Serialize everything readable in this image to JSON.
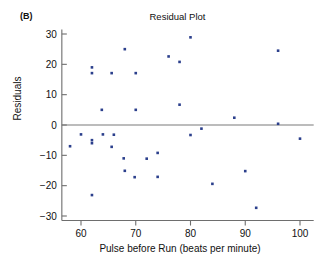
{
  "panel": {
    "label": "(B)"
  },
  "chart_data": {
    "type": "scatter",
    "title": "Residual Plot",
    "xlabel": "Pulse before Run (beats per minute)",
    "ylabel": "Residuals",
    "xlim": [
      56.5,
      102.5
    ],
    "ylim": [
      -31.5,
      31.5
    ],
    "xticks": [
      60,
      70,
      80,
      90,
      100
    ],
    "yticks": [
      30,
      20,
      10,
      0,
      -10,
      -20,
      -30
    ],
    "xtick_labels": [
      "60",
      "70",
      "80",
      "90",
      "100"
    ],
    "ytick_labels": [
      "30",
      "20",
      "10",
      "0",
      "−10",
      "−20",
      "−30"
    ],
    "grid": false,
    "legend": null,
    "reference_line": {
      "y": 0,
      "color": "#7a7a7a"
    },
    "marker": {
      "shape": "square",
      "size": 2.6,
      "color": "#2b3f8c"
    },
    "points": [
      {
        "x": 58.0,
        "y": -7.0
      },
      {
        "x": 60.0,
        "y": -3.1
      },
      {
        "x": 62.0,
        "y": 19.0
      },
      {
        "x": 62.0,
        "y": 17.1
      },
      {
        "x": 62.0,
        "y": -5.0
      },
      {
        "x": 62.0,
        "y": -6.0
      },
      {
        "x": 62.0,
        "y": -23.1
      },
      {
        "x": 63.8,
        "y": 5.0
      },
      {
        "x": 64.0,
        "y": -3.1
      },
      {
        "x": 65.6,
        "y": 17.1
      },
      {
        "x": 66.0,
        "y": -3.2
      },
      {
        "x": 65.6,
        "y": -7.2
      },
      {
        "x": 68.0,
        "y": 25.0
      },
      {
        "x": 67.8,
        "y": -11.0
      },
      {
        "x": 68.0,
        "y": -15.1
      },
      {
        "x": 70.0,
        "y": 17.1
      },
      {
        "x": 70.0,
        "y": 5.0
      },
      {
        "x": 69.8,
        "y": -17.2
      },
      {
        "x": 72.0,
        "y": -11.1
      },
      {
        "x": 74.0,
        "y": -9.2
      },
      {
        "x": 74.0,
        "y": -17.1
      },
      {
        "x": 76.0,
        "y": 22.6
      },
      {
        "x": 78.0,
        "y": 20.8
      },
      {
        "x": 78.0,
        "y": 6.7
      },
      {
        "x": 80.0,
        "y": 28.9
      },
      {
        "x": 80.0,
        "y": -3.3
      },
      {
        "x": 82.0,
        "y": -1.2
      },
      {
        "x": 84.0,
        "y": -19.4
      },
      {
        "x": 88.0,
        "y": 2.4
      },
      {
        "x": 90.0,
        "y": -15.2
      },
      {
        "x": 92.0,
        "y": -27.3
      },
      {
        "x": 96.0,
        "y": 24.5
      },
      {
        "x": 96.0,
        "y": 0.4
      },
      {
        "x": 100.0,
        "y": -4.5
      }
    ]
  }
}
